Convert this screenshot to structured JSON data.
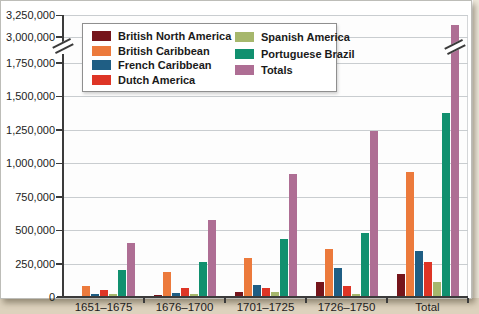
{
  "chart_data": {
    "type": "bar",
    "title": "",
    "xlabel": "",
    "ylabel": "",
    "categories": [
      "1651–1675",
      "1676–1700",
      "1701–1725",
      "1726–1750",
      "Total"
    ],
    "series": [
      {
        "name": "British North America",
        "color": "#75151b",
        "values": [
          10000,
          15000,
          40000,
          110000,
          170000
        ]
      },
      {
        "name": "British Caribbean",
        "color": "#ec7a3c",
        "values": [
          85000,
          190000,
          290000,
          360000,
          930000
        ]
      },
      {
        "name": "French Caribbean",
        "color": "#1f5e84",
        "values": [
          25000,
          30000,
          90000,
          220000,
          340000
        ]
      },
      {
        "name": "Dutch America",
        "color": "#de3526",
        "values": [
          55000,
          70000,
          65000,
          80000,
          260000
        ]
      },
      {
        "name": "Spanish America",
        "color": "#a6b76c",
        "values": [
          25000,
          25000,
          40000,
          25000,
          110000
        ]
      },
      {
        "name": "Portuguese Brazil",
        "color": "#11906f",
        "values": [
          200000,
          260000,
          430000,
          480000,
          1370000
        ]
      },
      {
        "name": "Totals",
        "color": "#ae6e94",
        "values": [
          400000,
          575000,
          920000,
          1240000,
          3140000
        ]
      }
    ],
    "y_axis": {
      "ticks": [
        {
          "value": 0,
          "label": "0"
        },
        {
          "value": 250000,
          "label": "250,000"
        },
        {
          "value": 500000,
          "label": "500,000"
        },
        {
          "value": 750000,
          "label": "750,000"
        },
        {
          "value": 1000000,
          "label": "1,000,000"
        },
        {
          "value": 1250000,
          "label": "1,250,000"
        },
        {
          "value": 1500000,
          "label": "1,500,000"
        },
        {
          "value": 1750000,
          "label": "1,750,000"
        },
        {
          "value": 3000000,
          "label": "3,000,000"
        },
        {
          "value": 3250000,
          "label": "3,250,000"
        }
      ],
      "axis_break": {
        "from": 1750000,
        "to": 3000000
      },
      "gridlines": true
    },
    "legend": {
      "position": "top-left",
      "columns": [
        [
          "British North America",
          "British Caribbean",
          "French Caribbean",
          "Dutch America"
        ],
        [
          "Spanish America",
          "Portuguese Brazil",
          "Totals"
        ]
      ]
    },
    "colors": {
      "gridline": "#c9cdd0",
      "axis": "#3b3b3b",
      "text": "#1c1c1c",
      "plot_background": "#fdfdfd"
    }
  }
}
